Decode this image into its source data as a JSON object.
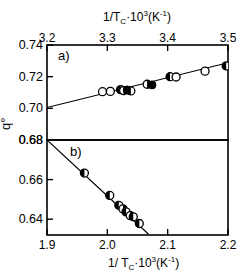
{
  "figure": {
    "ylabel": "q°",
    "top_axis_label_parts": {
      "base": "1/T",
      "sub": "C",
      "mid": "·10",
      "sup": "3",
      "unit": "(K",
      "unit_sup": "-1",
      "unit_end": ")"
    },
    "bottom_axis_label_parts": {
      "base": "1/ T",
      "sub": "C",
      "mid": "·10",
      "sup": "3",
      "unit": "(K",
      "unit_sup": "-1",
      "unit_end": ")"
    },
    "panel_a_label": "a)",
    "panel_b_label": "b)"
  },
  "chart_data": [
    {
      "type": "scatter",
      "panel": "a)",
      "title": "",
      "xlabel": "1/Tc·10^3 (K^-1)",
      "ylabel": "q°",
      "axis_position": {
        "x": "top",
        "y": "left"
      },
      "xlim": [
        3.2,
        3.5
      ],
      "ylim": [
        0.68,
        0.74
      ],
      "xticks": [
        3.2,
        3.3,
        3.4,
        3.5
      ],
      "xticklabels": [
        "3.2",
        "3.3",
        "3.4",
        "3.5"
      ],
      "yticks": [
        0.68,
        0.7,
        0.72,
        0.74
      ],
      "yticklabels": [
        "0.68",
        "0.70",
        "0.72",
        "0.74"
      ],
      "grid": false,
      "legend": "none",
      "fit_line": {
        "x": [
          3.2,
          3.5
        ],
        "y": [
          0.7005,
          0.7288
        ]
      },
      "points": [
        {
          "x": 3.292,
          "y": 0.7105,
          "marker": "open"
        },
        {
          "x": 3.305,
          "y": 0.7107,
          "marker": "open"
        },
        {
          "x": 3.322,
          "y": 0.7118,
          "marker": "half-left"
        },
        {
          "x": 3.327,
          "y": 0.7112,
          "marker": "half-right"
        },
        {
          "x": 3.333,
          "y": 0.7116,
          "marker": "filled"
        },
        {
          "x": 3.339,
          "y": 0.711,
          "marker": "half-left"
        },
        {
          "x": 3.366,
          "y": 0.7152,
          "marker": "half-right"
        },
        {
          "x": 3.374,
          "y": 0.7148,
          "marker": "filled"
        },
        {
          "x": 3.404,
          "y": 0.72,
          "marker": "half-left"
        },
        {
          "x": 3.414,
          "y": 0.7198,
          "marker": "open"
        },
        {
          "x": 3.462,
          "y": 0.7235,
          "marker": "open"
        },
        {
          "x": 3.497,
          "y": 0.7268,
          "marker": "half-left"
        }
      ]
    },
    {
      "type": "scatter",
      "panel": "b)",
      "title": "",
      "xlabel": "1/ Tc·10^3 (K^-1)",
      "ylabel": "q°",
      "axis_position": {
        "x": "bottom",
        "y": "left"
      },
      "xlim": [
        1.9,
        2.2
      ],
      "ylim": [
        0.632,
        0.68
      ],
      "xticks": [
        1.9,
        2.0,
        2.1,
        2.2
      ],
      "xticklabels": [
        "1.9",
        "2.0",
        "2.1",
        "2.2"
      ],
      "yticks": [
        0.64,
        0.66,
        0.68
      ],
      "yticklabels": [
        "0.64",
        "0.66",
        "0.68"
      ],
      "grid": false,
      "legend": "none",
      "fit_line": {
        "x": [
          1.9,
          2.068
        ],
        "y": [
          0.68,
          0.6325
        ]
      },
      "points": [
        {
          "x": 1.962,
          "y": 0.6633,
          "marker": "half-left"
        },
        {
          "x": 2.004,
          "y": 0.652,
          "marker": "half-left"
        },
        {
          "x": 2.019,
          "y": 0.647,
          "marker": "half-left"
        },
        {
          "x": 2.026,
          "y": 0.6452,
          "marker": "half-right"
        },
        {
          "x": 2.031,
          "y": 0.6437,
          "marker": "half-left"
        },
        {
          "x": 2.038,
          "y": 0.6418,
          "marker": "half-right"
        },
        {
          "x": 2.043,
          "y": 0.6412,
          "marker": "half-left"
        },
        {
          "x": 2.053,
          "y": 0.6378,
          "marker": "half-left"
        }
      ]
    }
  ]
}
